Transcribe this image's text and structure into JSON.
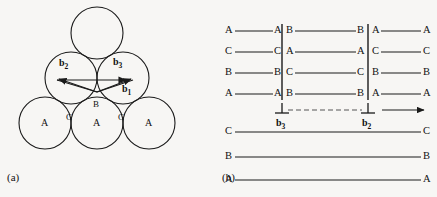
{
  "figure": {
    "background_color": "#f7f6f4",
    "ink_color": "#1a1a1a"
  },
  "panel_a": {
    "caption": "(a)",
    "spheres": [
      {
        "label": "",
        "cx": 97,
        "cy": 33,
        "r": 26
      },
      {
        "label": "",
        "cx": 71,
        "cy": 78,
        "r": 26
      },
      {
        "label": "",
        "cx": 123,
        "cy": 78,
        "r": 26
      },
      {
        "label": "A",
        "cx": 45,
        "cy": 123,
        "r": 26
      },
      {
        "label": "A",
        "cx": 97,
        "cy": 123,
        "r": 26
      },
      {
        "label": "A",
        "cx": 149,
        "cy": 123,
        "r": 26
      }
    ],
    "interstitial_sites": [
      {
        "label": "B",
        "x": 93,
        "y": 100
      },
      {
        "label": "C",
        "x": 67,
        "y": 114
      },
      {
        "label": "C",
        "x": 119,
        "y": 114
      }
    ],
    "vectors": [
      {
        "name": "b1",
        "label": "b",
        "sub": "1",
        "x1": 57,
        "y1": 80,
        "x2": 126,
        "y2": 80,
        "label_x": 124,
        "label_y": 85
      },
      {
        "name": "b2",
        "label": "b",
        "sub": "2",
        "x1": 97,
        "y1": 92,
        "x2": 59,
        "y2": 79,
        "label_x": 62,
        "label_y": 61
      },
      {
        "name": "b3",
        "label": "b",
        "sub": "3",
        "x1": 97,
        "y1": 92,
        "x2": 131,
        "y2": 79,
        "label_x": 114,
        "label_y": 60
      }
    ]
  },
  "panel_b": {
    "caption": "(b)",
    "left_x": 225,
    "right_x": 430,
    "boundary_left_x": 282,
    "boundary_right_x": 368,
    "rows": [
      {
        "y": 31,
        "segments": [
          {
            "region": "left",
            "left_label": "A",
            "right_label": "A"
          },
          {
            "region": "middle",
            "left_label": "B",
            "right_label": "B"
          },
          {
            "region": "right",
            "left_label": "A",
            "right_label": "A"
          }
        ]
      },
      {
        "y": 52,
        "segments": [
          {
            "region": "left",
            "left_label": "C",
            "right_label": "C"
          },
          {
            "region": "middle",
            "left_label": "A",
            "right_label": "A"
          },
          {
            "region": "right",
            "left_label": "C",
            "right_label": "C"
          }
        ]
      },
      {
        "y": 73,
        "segments": [
          {
            "region": "left",
            "left_label": "B",
            "right_label": "B"
          },
          {
            "region": "middle",
            "left_label": "C",
            "right_label": "C"
          },
          {
            "region": "right",
            "left_label": "B",
            "right_label": "B"
          }
        ]
      },
      {
        "y": 94,
        "segments": [
          {
            "region": "left",
            "left_label": "A",
            "right_label": "A"
          },
          {
            "region": "middle",
            "left_label": "B",
            "right_label": "B"
          },
          {
            "region": "right",
            "left_label": "A",
            "right_label": "A"
          }
        ]
      }
    ],
    "full_rows": [
      {
        "y": 132,
        "left_label": "C",
        "right_label": "C"
      },
      {
        "y": 157,
        "left_label": "B",
        "right_label": "B"
      },
      {
        "y": 180,
        "left_label": "A",
        "right_label": "A"
      }
    ],
    "dislocations": [
      {
        "name": "partial-left",
        "x": 282,
        "y": 110,
        "vector_label": "b",
        "vector_sub": "3",
        "vector_x": 276,
        "vector_y": 140
      },
      {
        "name": "partial-right",
        "x": 368,
        "y": 110,
        "vector_label": "b",
        "vector_sub": "2",
        "vector_x": 362,
        "vector_y": 140
      }
    ],
    "fault_ribbon": {
      "x1": 287,
      "x2": 363,
      "y": 110
    },
    "glide_arrow": {
      "x1": 382,
      "x2": 424,
      "y": 110
    }
  }
}
